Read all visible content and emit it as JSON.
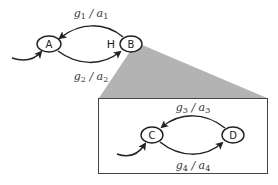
{
  "diagram": {
    "outer_states": [
      {
        "id": "A",
        "label": "A"
      },
      {
        "id": "B",
        "label": "B"
      }
    ],
    "history_marker": "H",
    "outer_transitions": [
      {
        "from": "B",
        "to": "A",
        "guard": "g",
        "guard_sub": "1",
        "sep": " / ",
        "action": "a",
        "action_sub": "1"
      },
      {
        "from": "A",
        "to": "B",
        "guard": "g",
        "guard_sub": "2",
        "sep": " / ",
        "action": "a",
        "action_sub": "2"
      }
    ],
    "inner_states": [
      {
        "id": "C",
        "label": "C"
      },
      {
        "id": "D",
        "label": "D"
      }
    ],
    "inner_transitions": [
      {
        "from": "D",
        "to": "C",
        "guard": "g",
        "guard_sub": "3",
        "sep": " / ",
        "action": "a",
        "action_sub": "3"
      },
      {
        "from": "C",
        "to": "D",
        "guard": "g",
        "guard_sub": "4",
        "sep": " / ",
        "action": "a",
        "action_sub": "4"
      }
    ],
    "colors": {
      "zoom_wedge": "#b3b3b3",
      "stroke": "#222222"
    }
  }
}
